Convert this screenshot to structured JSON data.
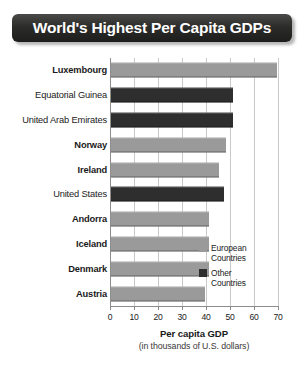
{
  "title": "World's Highest Per Capita GDPs",
  "legend": {
    "entries": [
      {
        "label_line1": "European",
        "label_line2": "Countries",
        "swatch": "euro",
        "color": "#9a9a9a"
      },
      {
        "label_line1": "Other",
        "label_line2": "Countries",
        "swatch": "other",
        "color": "#2e2e2e"
      }
    ]
  },
  "axis": {
    "title": "Per capita GDP",
    "subtitle": "(in thousands of U.S. dollars)",
    "ticks": [
      "0",
      "10",
      "20",
      "30",
      "40",
      "50",
      "60",
      "70"
    ]
  },
  "chart_data": {
    "type": "bar",
    "orientation": "horizontal",
    "title": "World's Highest Per Capita GDPs",
    "xlabel": "Per capita GDP (in thousands of U.S. dollars)",
    "ylabel": "",
    "xlim": [
      0,
      70
    ],
    "xticks": [
      0,
      10,
      20,
      30,
      40,
      50,
      60,
      70
    ],
    "grid": true,
    "legend_position": "inside-right",
    "categories": [
      "Luxembourg",
      "Equatorial Guinea",
      "United Arab Emirates",
      "Norway",
      "Ireland",
      "United States",
      "Andorra",
      "Iceland",
      "Denmark",
      "Austria"
    ],
    "values": [
      69,
      51,
      51,
      48,
      45,
      47,
      41,
      41,
      41,
      39
    ],
    "groups": [
      "European",
      "Other",
      "Other",
      "European",
      "European",
      "Other",
      "European",
      "European",
      "European",
      "European"
    ],
    "series": [
      {
        "name": "European Countries",
        "color": "#9a9a9a"
      },
      {
        "name": "Other Countries",
        "color": "#2e2e2e"
      }
    ]
  }
}
